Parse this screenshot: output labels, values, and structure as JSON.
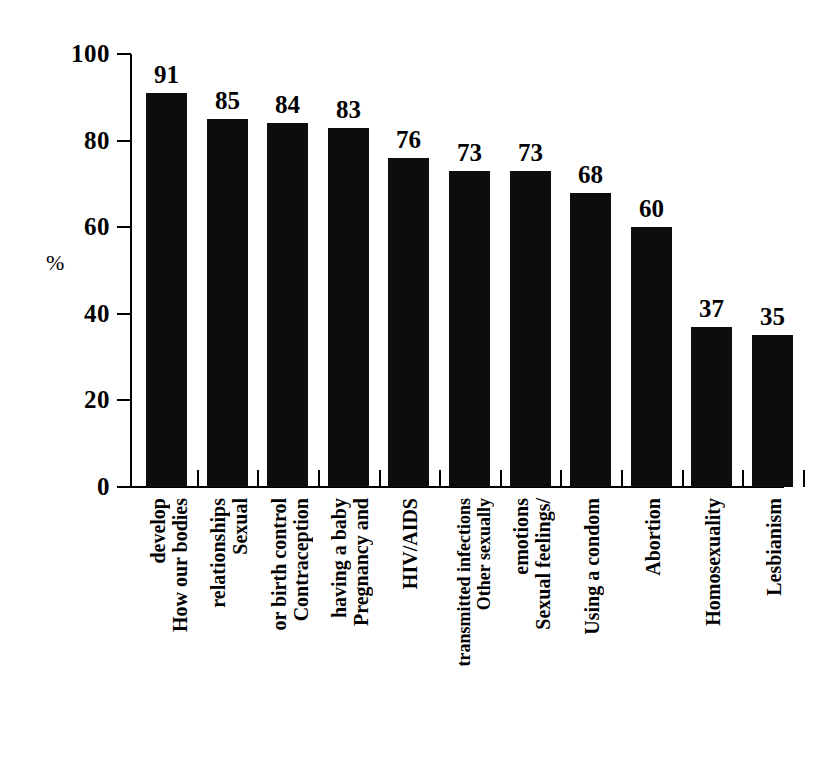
{
  "chart_data": {
    "type": "bar",
    "title": "",
    "subtitle": "",
    "xlabel": "",
    "ylabel": "%",
    "ylim": [
      0,
      100
    ],
    "ytick_labels": [
      "100",
      "80",
      "60",
      "40",
      "20",
      "0"
    ],
    "ytick_values": [
      100,
      80,
      60,
      40,
      20,
      0
    ],
    "grid": false,
    "legend": null,
    "bar_color": "#0d0d0d",
    "categories": [
      "How our bodies develop",
      "Sexual relationships",
      "Contraception or birth control",
      "Pregnancy and having a baby",
      "HIV/AIDS",
      "Other sexually transmitted infections",
      "Sexual feelings/ emotions",
      "Using a condom",
      "Abortion",
      "Homosexuality",
      "Lesbianism"
    ],
    "category_lines": [
      [
        "How our bodies",
        "develop"
      ],
      [
        "Sexual",
        "relationships"
      ],
      [
        "Contraception",
        "or birth control"
      ],
      [
        "Pregnancy and",
        "having a baby"
      ],
      [
        "HIV/AIDS"
      ],
      [
        "Other sexually",
        "transmitted infections"
      ],
      [
        "Sexual feelings/",
        "emotions"
      ],
      [
        "Using a condom"
      ],
      [
        "Abortion"
      ],
      [
        "Homosexuality"
      ],
      [
        "Lesbianism"
      ]
    ],
    "values": [
      91,
      85,
      84,
      83,
      76,
      73,
      73,
      68,
      60,
      37,
      35
    ],
    "value_labels": [
      "91",
      "85",
      "84",
      "83",
      "76",
      "73",
      "73",
      "68",
      "60",
      "37",
      "35"
    ]
  }
}
